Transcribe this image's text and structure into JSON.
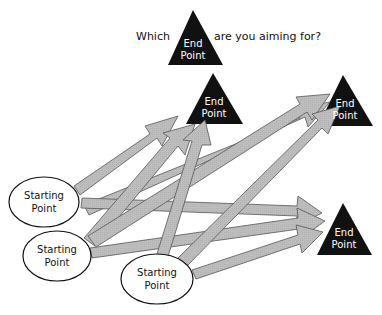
{
  "question": {
    "prefix": "Which",
    "suffix": "are you aiming for?",
    "inline_shape_label_line1": "End",
    "inline_shape_label_line2": "Point"
  },
  "end_points": [
    {
      "id": "end-1",
      "line1": "End",
      "line2": "Point"
    },
    {
      "id": "end-2",
      "line1": "End",
      "line2": "Point"
    },
    {
      "id": "end-3",
      "line1": "End",
      "line2": "Point"
    }
  ],
  "starting_points": [
    {
      "id": "start-1",
      "line1": "Starting",
      "line2": "Point"
    },
    {
      "id": "start-2",
      "line1": "Starting",
      "line2": "Point"
    },
    {
      "id": "start-3",
      "line1": "Starting",
      "line2": "Point"
    }
  ],
  "colors": {
    "triangle_fill": "#111111",
    "arrow_fill": "#bdbdbd",
    "arrow_stroke": "#555555",
    "ellipse_stroke": "#111111",
    "ellipse_fill": "#ffffff"
  }
}
